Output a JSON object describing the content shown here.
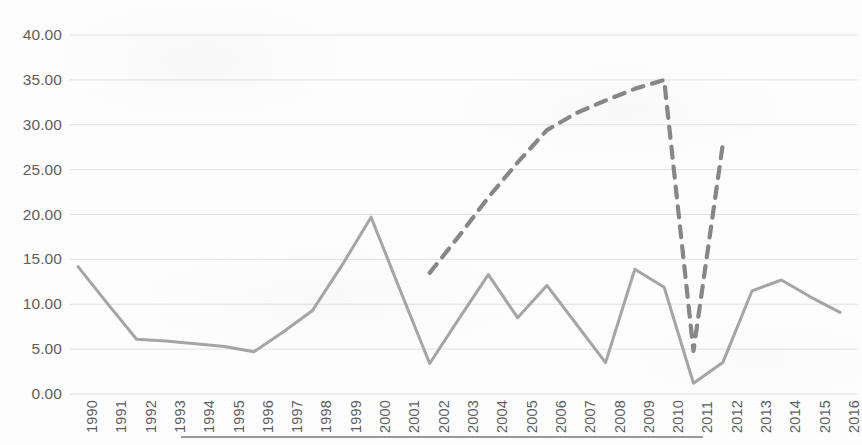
{
  "chart_data": {
    "type": "line",
    "title": "",
    "subtitle": "",
    "xlabel": "",
    "ylabel": "",
    "grid": true,
    "legend": "none",
    "ylim": [
      0,
      40
    ],
    "ytick_step": 5,
    "ytick_labels": [
      "0.00",
      "5.00",
      "10.00",
      "15.00",
      "20.00",
      "25.00",
      "30.00",
      "35.00",
      "40.00"
    ],
    "ytick_values": [
      0,
      5,
      10,
      15,
      20,
      25,
      30,
      35,
      40
    ],
    "categories": [
      "1990",
      "1991",
      "1992",
      "1993",
      "1994",
      "1995",
      "1996",
      "1997",
      "1998",
      "1999",
      "2000",
      "2001",
      "2002",
      "2003",
      "2004",
      "2005",
      "2006",
      "2007",
      "2008",
      "2009",
      "2010",
      "2011",
      "2012",
      "2013",
      "2014",
      "2015",
      "2016"
    ],
    "x": [
      1990,
      1991,
      1992,
      1993,
      1994,
      1995,
      1996,
      1997,
      1998,
      1999,
      2000,
      2001,
      2002,
      2003,
      2004,
      2005,
      2006,
      2007,
      2008,
      2009,
      2010,
      2011,
      2012,
      2013,
      2014,
      2015,
      2016
    ],
    "series": [
      {
        "name": "solid-series",
        "style": "solid",
        "color": "#999999",
        "x": [
          1990,
          1991,
          1992,
          1993,
          1994,
          1995,
          1996,
          1997,
          1998,
          1999,
          2000,
          2001,
          2002,
          2003,
          2004,
          2005,
          2006,
          2007,
          2008,
          2009,
          2010,
          2011,
          2012,
          2013,
          2014,
          2015,
          2016
        ],
        "values": [
          14.2,
          10.1,
          6.1,
          5.9,
          5.6,
          5.3,
          4.7,
          6.9,
          9.3,
          14.3,
          19.7,
          11.5,
          3.4,
          8.4,
          13.3,
          8.5,
          12.1,
          7.8,
          3.5,
          13.9,
          11.9,
          1.2,
          3.5,
          11.5,
          12.7,
          10.8,
          9.1
        ]
      },
      {
        "name": "dashed-series",
        "style": "dashed",
        "color": "#7d7d7d",
        "x": [
          2002,
          2003,
          2004,
          2005,
          2006,
          2007,
          2008,
          2009,
          2010,
          2011,
          2012
        ],
        "values": [
          13.5,
          17.6,
          21.9,
          25.8,
          29.4,
          31.3,
          32.7,
          34.0,
          35.0,
          4.8,
          27.8
        ]
      }
    ]
  },
  "axes": {
    "bottom_rule": true
  }
}
